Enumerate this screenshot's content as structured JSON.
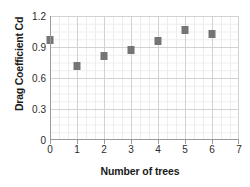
{
  "chart_data": {
    "type": "scatter",
    "title": "",
    "xlabel": "Number of trees",
    "ylabel": "Drag Coefficient Cd",
    "x": [
      0,
      1,
      2,
      3,
      4,
      5,
      6
    ],
    "values": [
      0.97,
      0.72,
      0.81,
      0.87,
      0.96,
      1.06,
      1.03
    ],
    "series": [
      {
        "name": "Drag Coefficient Cd",
        "values": [
          0.97,
          0.72,
          0.81,
          0.87,
          0.96,
          1.06,
          1.03
        ]
      }
    ],
    "xlim": [
      0,
      7
    ],
    "ylim": [
      0,
      1.2
    ],
    "x_ticks": [
      "0",
      "1",
      "2",
      "3",
      "4",
      "5",
      "6",
      "7"
    ],
    "x_tick_values": [
      0,
      1,
      2,
      3,
      4,
      5,
      6,
      7
    ],
    "y_ticks": [
      "1.2",
      "0.9",
      "0.6",
      "0.3",
      "0"
    ],
    "y_tick_values": [
      1.2,
      0.9,
      0.6,
      0.3,
      0
    ],
    "grid": "major-and-minor",
    "legend": "none",
    "marker": "square",
    "marker_color": "#757575",
    "grid_color": "#d2d2d2",
    "minor_grid_color": "#f0ecee",
    "axis_color": "#9a9a9a",
    "text_color": "#1a1a1a"
  }
}
